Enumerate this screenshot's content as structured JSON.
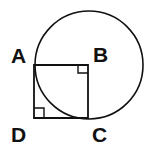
{
  "diagram": {
    "type": "geometry",
    "labels": {
      "A": "A",
      "B": "B",
      "C": "C",
      "D": "D"
    },
    "points": {
      "A": [
        34,
        65
      ],
      "B": [
        88,
        65
      ],
      "C": [
        88,
        119
      ],
      "D": [
        34,
        119
      ]
    },
    "circle": {
      "center": "B",
      "cx": 89,
      "cy": 65,
      "r": 54
    },
    "right_angles": [
      "B",
      "D"
    ],
    "stroke_color": "#111111"
  }
}
